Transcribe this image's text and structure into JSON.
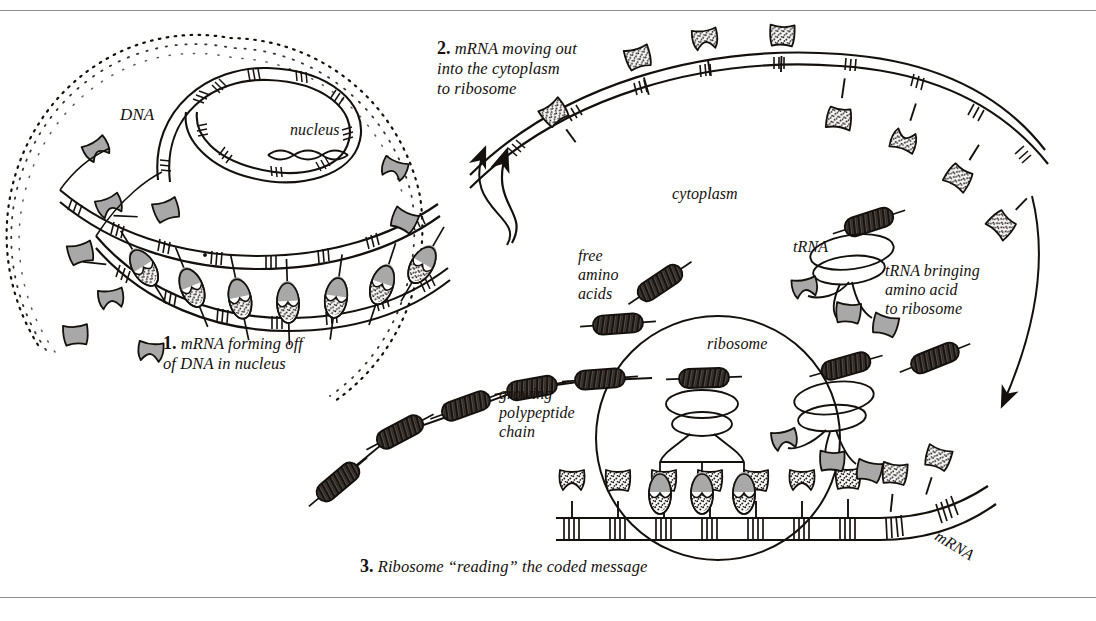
{
  "figure": {
    "style": "pen-and-ink scientific textbook illustration",
    "background": "#ffffff",
    "ink_color": "#14100d",
    "fill_gray": "#a8a8a8",
    "rule_color": "#8e8e8e"
  },
  "steps": [
    {
      "number": "1.",
      "text": " mRNA forming off\nof DNA in nucleus"
    },
    {
      "number": "2.",
      "text": " mRNA moving out\ninto the cytoplasm\nto ribosome"
    },
    {
      "number": "3.",
      "text": " Ribosome “reading” the coded message"
    }
  ],
  "labels": {
    "dna": "DNA",
    "nucleus": "nucleus",
    "cytoplasm": "cytoplasm",
    "trna": "tRNA",
    "trna_bringing": "tRNA bringing\namino acid\nto ribosome",
    "free_amino_acids": "free\namino\nacids",
    "ribosome": "ribosome",
    "growing_polypeptide": "growing\npolypeptide\nchain",
    "mrna": "mRNA"
  },
  "diagram_elements": {
    "nucleus_membrane": "stippled dotted arc enclosing nucleus at upper left",
    "dna_strand": "ladder-like double strand looping through nucleus with hatched rungs",
    "mrna_in_nucleus": "inner ladder strand forming along DNA with paired bases",
    "paired_bases": "gray top half joined to stippled bottom half on stalks",
    "cell_membrane": "large arc sweeping across upper right",
    "mrna_cytoplasm": "hatched ribbon strand with stippled bases on both sides",
    "ribosome_body": "large circle enclosing mRNA reading site",
    "trna_molecule": "stacked ovals with trapezoid fork holding three anticodon bases",
    "amino_acid": "dark cross-hatched capsule with line stubs at both ends",
    "polypeptide_chain": "zigzag chain of dark capsules linked by thin lines",
    "arrow_to_cytoplasm": "curved arrow pointing up-right from nucleus",
    "arrow_down_right": "long curved arrow sweeping down on the right edge"
  }
}
